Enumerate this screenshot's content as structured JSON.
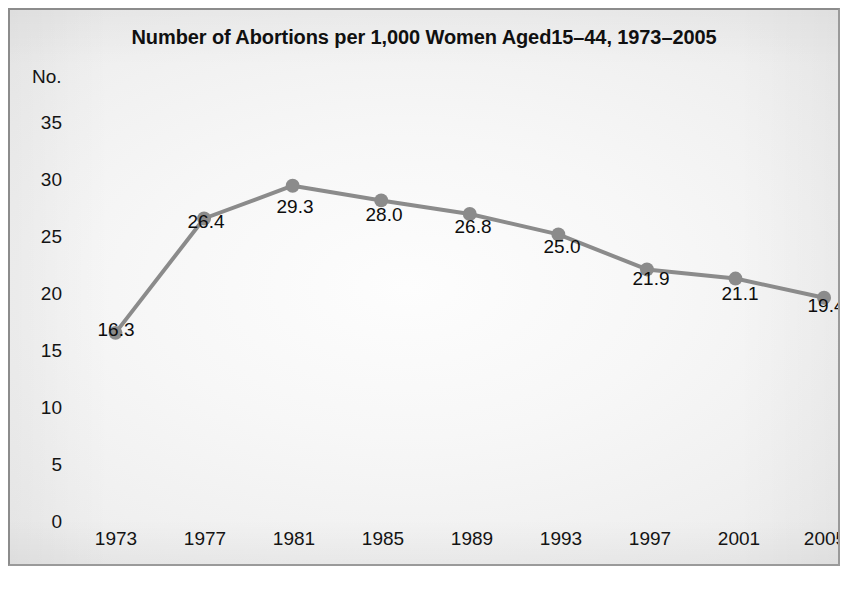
{
  "chart_data": {
    "type": "line",
    "title": "Number of Abortions per 1,000 Women Aged15–44, 1973–2005",
    "xlabel": "",
    "ylabel": "No.",
    "categories": [
      "1973",
      "1977",
      "1981",
      "1985",
      "1989",
      "1993",
      "1997",
      "2001",
      "2005"
    ],
    "values": [
      16.3,
      26.4,
      29.3,
      28.0,
      26.8,
      25.0,
      21.9,
      21.1,
      19.4
    ],
    "point_labels": [
      "16.3",
      "26.4",
      "29.3",
      "28.0",
      "26.8",
      "25.0",
      "21.9",
      "21.1",
      "19.4"
    ],
    "ylim": [
      0,
      37
    ],
    "yticks": [
      35,
      30,
      25,
      20,
      15,
      10,
      5,
      0
    ],
    "ytick_labels": [
      "35",
      "30",
      "25",
      "20",
      "15",
      "10",
      "5",
      "0"
    ],
    "grid": false,
    "legend": null,
    "series_color": "#8b8b8b",
    "marker_color": "#8b8b8b",
    "text_color": "#101010",
    "frame_color": "#8c8c8c",
    "background_color": "#f2f2f2"
  },
  "axis": {
    "y_caption": "No.",
    "y_ticks": [
      "35",
      "30",
      "25",
      "20",
      "15",
      "10",
      "5",
      "0"
    ],
    "x_ticks": [
      "1973",
      "1977",
      "1981",
      "1985",
      "1989",
      "1993",
      "1997",
      "2001",
      "2005"
    ]
  },
  "labels": {
    "v0": "16.3",
    "v1": "26.4",
    "v2": "29.3",
    "v3": "28.0",
    "v4": "26.8",
    "v5": "25.0",
    "v6": "21.9",
    "v7": "21.1",
    "v8": "19.4"
  }
}
